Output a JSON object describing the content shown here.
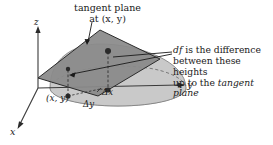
{
  "figure": {
    "title_lines": [
      "tangent plane",
      "at (x, y)"
    ],
    "annotation_lines": [
      "df is the difference",
      "between these heights",
      "up to the tangent plane"
    ],
    "annotation_emphasis": {
      "line1_italic": "df",
      "line3_italic": "tangent plane"
    },
    "axes": {
      "z_label": "z",
      "y_label": "y",
      "x_label": "x"
    },
    "point_label": "(x, y)",
    "increment_labels": {
      "delta_y": "Δy",
      "delta_x": "Δx"
    },
    "colors": {
      "background": "#ffffff",
      "plane_fill": "#8a8a8a",
      "plane_stroke": "#2b2b2b",
      "dome_fill": "#c9c9c9",
      "dome_base_fill": "#d8d8d8",
      "dome_stroke": "#6a6a6a",
      "axis_stroke": "#3a3a3a",
      "text": "#1a1a1a",
      "dot_fill": "#2b2b2b",
      "dashed_stroke": "#3a3a3a",
      "leader_stroke": "#1a1a1a"
    },
    "geometry_notes": {
      "view": "3d-perspective-axonometric",
      "surface": "paraboloid-dome",
      "plane": "tangent-parallelogram"
    }
  }
}
